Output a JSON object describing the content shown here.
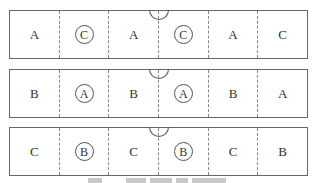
{
  "panels": [
    {
      "id": "row-1",
      "cells": [
        {
          "label": "A",
          "circled": false
        },
        {
          "label": "C",
          "circled": true
        },
        {
          "label": "A",
          "circled": false
        },
        {
          "label": "C",
          "circled": true
        },
        {
          "label": "A",
          "circled": false
        },
        {
          "label": "C",
          "circled": false
        }
      ]
    },
    {
      "id": "row-2",
      "cells": [
        {
          "label": "B",
          "circled": false
        },
        {
          "label": "A",
          "circled": true
        },
        {
          "label": "B",
          "circled": false
        },
        {
          "label": "A",
          "circled": true
        },
        {
          "label": "B",
          "circled": false
        },
        {
          "label": "A",
          "circled": false
        }
      ]
    },
    {
      "id": "row-3",
      "cells": [
        {
          "label": "C",
          "circled": false
        },
        {
          "label": "B",
          "circled": true
        },
        {
          "label": "C",
          "circled": false
        },
        {
          "label": "B",
          "circled": true
        },
        {
          "label": "C",
          "circled": false
        },
        {
          "label": "B",
          "circled": false
        }
      ]
    }
  ],
  "caption": ""
}
